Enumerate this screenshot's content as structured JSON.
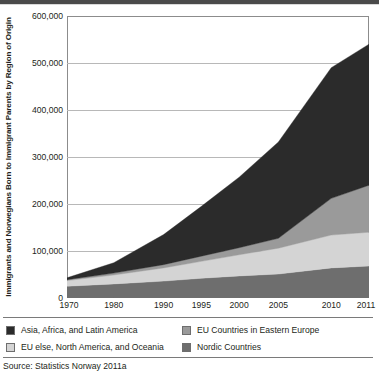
{
  "figure": {
    "source_note": "Source: Statistics Norway 2011a"
  },
  "chart_data": {
    "type": "area",
    "stacked": true,
    "title": "",
    "subtitle": "",
    "xlabel": "",
    "ylabel": "Immigrants and Norwegians Born to Immigrant Parents by Region of Origin",
    "x": [
      1970,
      1980,
      1990,
      1995,
      2000,
      2005,
      2010,
      2011
    ],
    "xtick_labels": [
      "1970",
      "1980",
      "1990",
      "1995",
      "2000",
      "2005",
      "2010",
      "2011"
    ],
    "ytick_labels": [
      "0",
      "100,000",
      "200,000",
      "300,000",
      "400,000",
      "500,000",
      "600,000"
    ],
    "ytick_values": [
      0,
      100000,
      200000,
      300000,
      400000,
      500000,
      600000
    ],
    "ylim": [
      0,
      600000
    ],
    "grid": "horizontal",
    "legend_position": "below",
    "stack_order_bottom_to_top": [
      "Nordic Countries",
      "EU else, North America, and Oceania",
      "EU Countries in Eastern Europe",
      "Asia, Africa, and Latin America"
    ],
    "series": [
      {
        "name": "Nordic Countries",
        "color": "#6e6e6e",
        "values": [
          25000,
          30000,
          36000,
          42000,
          47000,
          51000,
          64000,
          68000
        ]
      },
      {
        "name": "EU else, North America, and Oceania",
        "color": "#d4d4d4",
        "values": [
          12000,
          19000,
          28000,
          36000,
          45000,
          55000,
          70000,
          72000
        ]
      },
      {
        "name": "EU Countries in Eastern Europe",
        "color": "#9a9a9a",
        "values": [
          2000,
          4000,
          7000,
          11000,
          15000,
          21000,
          78000,
          100000
        ]
      },
      {
        "name": "Asia, Africa, and Latin America",
        "color": "#2b2b2b",
        "values": [
          4000,
          22000,
          64000,
          106000,
          150000,
          205000,
          278000,
          300000
        ]
      }
    ],
    "cumulative_totals": [
      43000,
      75000,
      135000,
      195000,
      257000,
      332000,
      490000,
      540000
    ]
  },
  "legend": {
    "items": [
      {
        "label": "Asia, Africa, and Latin America",
        "color": "#2b2b2b"
      },
      {
        "label": "EU else, North America, and Oceania",
        "color": "#d4d4d4"
      },
      {
        "label": "EU Countries in Eastern Europe",
        "color": "#9a9a9a"
      },
      {
        "label": "Nordic Countries",
        "color": "#6e6e6e"
      }
    ]
  }
}
